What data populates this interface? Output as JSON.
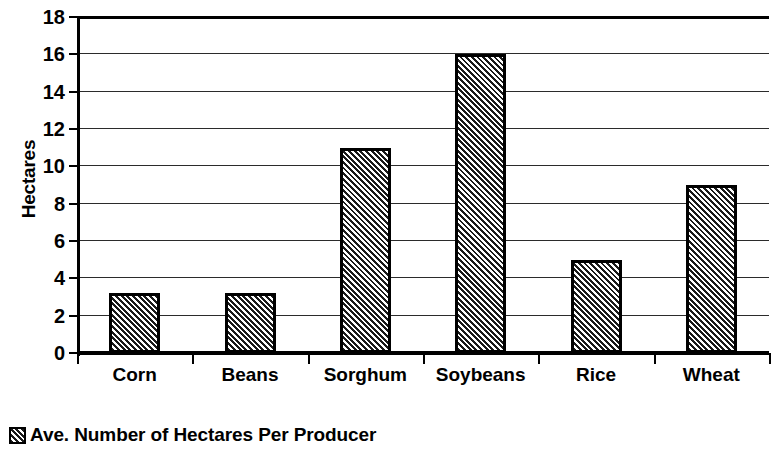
{
  "chart_data": {
    "type": "bar",
    "title": "",
    "subtitle": "",
    "xlabel": "",
    "ylabel": "Hectares",
    "categories": [
      "Corn",
      "Beans",
      "Sorghum",
      "Soybeans",
      "Rice",
      "Wheat"
    ],
    "values": [
      3.2,
      3.2,
      11,
      16,
      5,
      9
    ],
    "series": [
      {
        "name": "Ave. Number of Hectares Per Producer",
        "values": [
          3.2,
          3.2,
          11,
          16,
          5,
          9
        ]
      }
    ],
    "ylim": [
      0,
      18
    ],
    "y_ticks": [
      0,
      2,
      4,
      6,
      8,
      10,
      12,
      14,
      16,
      18
    ],
    "y_tick_labels": [
      "0",
      "2",
      "4",
      "6",
      "8",
      "10",
      "12",
      "14",
      "16",
      "18"
    ],
    "grid": true,
    "grid_axis": "y",
    "legend": [
      "Ave. Number of Hectares Per Producer"
    ],
    "legend_position": "bottom-left",
    "bar_fill": "diagonal-hatch",
    "bar_border_color": "#000000",
    "bar_fill_color": "#1a1a1a",
    "background_color": "#ffffff",
    "axis_color": "#000000"
  },
  "legend": {
    "swatch_name": "hatched-square-swatch",
    "label": "Ave. Number of Hectares Per Producer"
  }
}
